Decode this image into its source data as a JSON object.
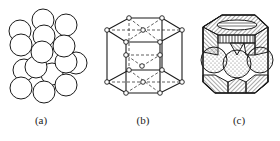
{
  "figure": {
    "panels": [
      {
        "id": "a",
        "label": "(a)",
        "description": "close-packed spheres model"
      },
      {
        "id": "b",
        "label": "(b)",
        "description": "hexagonal close-packed unit cell (ball-and-stick)"
      },
      {
        "id": "c",
        "label": "(c)",
        "description": "hexagonal unit cell sectioned sphere model"
      }
    ],
    "colors": {
      "line": "#1a1a1a",
      "background": "#ffffff"
    }
  }
}
